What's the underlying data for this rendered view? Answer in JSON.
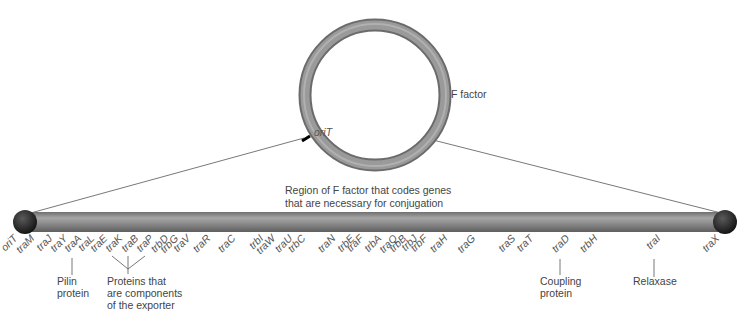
{
  "plasmid": {
    "name": "F factor",
    "origin_label": "oriT"
  },
  "region_caption": {
    "line1": "Region of F factor that codes genes",
    "line2": "that are necessary for conjugation"
  },
  "genes": [
    {
      "name": "oriT",
      "x": 10
    },
    {
      "name": "traM",
      "x": 27
    },
    {
      "name": "traJ",
      "x": 45
    },
    {
      "name": "traY",
      "x": 60
    },
    {
      "name": "traA",
      "x": 74
    },
    {
      "name": "traL",
      "x": 87
    },
    {
      "name": "traE",
      "x": 100
    },
    {
      "name": "traK",
      "x": 115
    },
    {
      "name": "traB",
      "x": 131
    },
    {
      "name": "traP",
      "x": 146
    },
    {
      "name": "trbD",
      "x": 161
    },
    {
      "name": "trbG",
      "x": 171
    },
    {
      "name": "traV",
      "x": 183
    },
    {
      "name": "traR",
      "x": 203
    },
    {
      "name": "traC",
      "x": 228
    },
    {
      "name": "trbI",
      "x": 256
    },
    {
      "name": "traW",
      "x": 268
    },
    {
      "name": "traU",
      "x": 285
    },
    {
      "name": "trbC",
      "x": 298
    },
    {
      "name": "traN",
      "x": 328
    },
    {
      "name": "trbE",
      "x": 347
    },
    {
      "name": "traF",
      "x": 356
    },
    {
      "name": "trbA",
      "x": 374
    },
    {
      "name": "traQ",
      "x": 390
    },
    {
      "name": "trbB",
      "x": 399
    },
    {
      "name": "trbJ",
      "x": 410
    },
    {
      "name": "trbF",
      "x": 420
    },
    {
      "name": "traH",
      "x": 440
    },
    {
      "name": "traG",
      "x": 468
    },
    {
      "name": "traS",
      "x": 508
    },
    {
      "name": "traT",
      "x": 526
    },
    {
      "name": "traD",
      "x": 562
    },
    {
      "name": "trbH",
      "x": 590
    },
    {
      "name": "traI",
      "x": 653
    },
    {
      "name": "traX",
      "x": 712
    }
  ],
  "annotations": {
    "pilin": {
      "line1": "Pilin",
      "line2": "protein"
    },
    "exporter": {
      "line1": "Proteins that",
      "line2": "are components",
      "line3": "of the exporter"
    },
    "coupling": {
      "line1": "Coupling",
      "line2": "protein"
    },
    "relaxase": {
      "line1": "Relaxase"
    }
  },
  "colors": {
    "ring": "#8a8a8a",
    "tube": "#8c8c8c",
    "cap": "#2e2e2e",
    "origin_mark": "#000000"
  }
}
